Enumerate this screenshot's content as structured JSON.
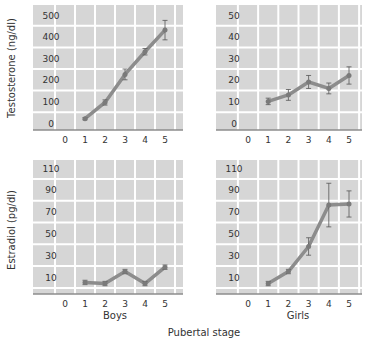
{
  "figure": {
    "xlabel": "Pubertal stage",
    "row_labels": [
      "Testosterone (ng/dl)",
      "Estradiol (pg/dl)"
    ],
    "column_labels": [
      "Boys",
      "Girls"
    ],
    "colors": {
      "panel_bg": "#d6d6d6",
      "grid": "#ffffff",
      "line": "#8c8c8c",
      "error_bar": "#555555",
      "axis": "#8c8c8c",
      "text": "#333333"
    }
  },
  "chart_data": [
    {
      "type": "line",
      "panel": "top-left",
      "title": "",
      "group": "Boys",
      "ylabel": "Testosterone (ng/dl)",
      "xlabel": "Pubertal stage",
      "x_ticks": [
        0,
        1,
        2,
        3,
        4,
        5
      ],
      "y_ticks": [
        0,
        100,
        200,
        300,
        400,
        500
      ],
      "ylim": [
        -20,
        540
      ],
      "grid": true,
      "x": [
        1,
        2,
        3,
        4,
        5
      ],
      "values": [
        20,
        95,
        225,
        330,
        430
      ],
      "error": [
        5,
        12,
        25,
        15,
        45
      ]
    },
    {
      "type": "line",
      "panel": "top-right",
      "title": "",
      "group": "Girls",
      "ylabel": "Testosterone (ng/dl)",
      "xlabel": "Pubertal stage",
      "x_ticks": [
        0,
        1,
        2,
        3,
        4,
        5
      ],
      "y_ticks": [
        0,
        10,
        20,
        30,
        40,
        50
      ],
      "ylim": [
        -2,
        54
      ],
      "grid": true,
      "x": [
        1,
        2,
        3,
        4,
        5
      ],
      "values": [
        10,
        13,
        19,
        16,
        22
      ],
      "error": [
        1.5,
        2.5,
        3,
        2.5,
        4
      ]
    },
    {
      "type": "line",
      "panel": "bottom-left",
      "title": "",
      "group": "Boys",
      "ylabel": "Estradiol (pg/dl)",
      "xlabel": "Pubertal stage",
      "x_ticks": [
        0,
        1,
        2,
        3,
        4,
        5
      ],
      "y_ticks": [
        10,
        30,
        50,
        70,
        90,
        110
      ],
      "ylim": [
        -5,
        118
      ],
      "grid": true,
      "x": [
        1,
        2,
        3,
        4,
        5
      ],
      "values": [
        5,
        4,
        15,
        4,
        19
      ],
      "error": [
        2,
        2,
        2,
        2,
        2
      ]
    },
    {
      "type": "line",
      "panel": "bottom-right",
      "title": "",
      "group": "Girls",
      "ylabel": "Estradiol (pg/dl)",
      "xlabel": "Pubertal stage",
      "x_ticks": [
        0,
        1,
        2,
        3,
        4,
        5
      ],
      "y_ticks": [
        10,
        30,
        50,
        70,
        90,
        110
      ],
      "ylim": [
        -5,
        118
      ],
      "grid": true,
      "x": [
        1,
        2,
        3,
        4,
        5
      ],
      "values": [
        4,
        15,
        38,
        76,
        77
      ],
      "error": [
        2,
        2,
        8,
        20,
        12
      ]
    }
  ]
}
